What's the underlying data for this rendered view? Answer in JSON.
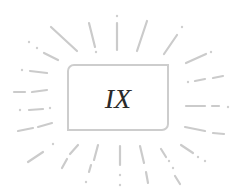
{
  "badge": {
    "label": "IX",
    "meaning": "Roman numeral nine"
  },
  "colors": {
    "background": "#ffffff",
    "rays": "#cbcbcb",
    "frame_border": "#cdcdcd",
    "numeral_text": "#2a2a2a"
  },
  "decoration": {
    "style": "sunburst-dashed-rays",
    "frame_corners": "top-left and bottom-right rounded"
  }
}
